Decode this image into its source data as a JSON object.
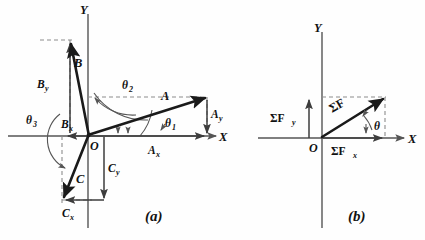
{
  "figure": {
    "background_color": "#fefefe",
    "vector_color": "#1a1a1a",
    "axis_color": "#555555",
    "dash_color": "#8c8c8c"
  },
  "panel_a": {
    "caption": "(a)",
    "axis_x_label": "X",
    "axis_y_label": "Y",
    "origin_label": "O",
    "vectors": [
      {
        "name": "A",
        "label": "A",
        "angle_label": "θ",
        "angle_sub": "1",
        "x_component_label": "A",
        "x_component_sub": "x",
        "y_component_label": "A",
        "y_component_sub": "y",
        "quadrant": "I",
        "tip_x": 207,
        "tip_y": 97
      },
      {
        "name": "B",
        "label": "B",
        "angle_label": "θ",
        "angle_sub": "2",
        "x_component_label": "B",
        "x_component_sub": "x",
        "y_component_label": "B",
        "y_component_sub": "y",
        "quadrant": "II",
        "tip_x": 70,
        "tip_y": 40
      },
      {
        "name": "C",
        "label": "C",
        "angle_label": "θ",
        "angle_sub": "3",
        "x_component_label": "C",
        "x_component_sub": "x",
        "y_component_label": "C",
        "y_component_sub": "y",
        "quadrant": "III",
        "tip_x": 62,
        "tip_y": 200
      }
    ]
  },
  "panel_b": {
    "caption": "(b)",
    "axis_x_label": "X",
    "axis_y_label": "Y",
    "origin_label": "O",
    "resultant_label": "ΣF",
    "x_component_label": "ΣF",
    "x_component_sub": "x",
    "y_component_label": "ΣF",
    "y_component_sub": "y",
    "angle_label": "θ",
    "tip_x": 385,
    "tip_y": 98
  }
}
